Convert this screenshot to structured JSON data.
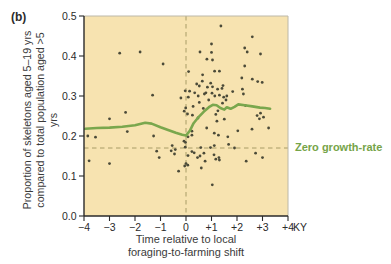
{
  "figure_label": "(b)",
  "colors": {
    "plot_bg": "#f7e3b0",
    "point": "#4b4a38",
    "trend": "#7aa74d",
    "reference": "#a89c66",
    "axis": "#2a2a2a",
    "tick_text": "#2b2b2b",
    "frame": "#bcb8a8",
    "label_green": "#76a449"
  },
  "chart_data": {
    "type": "scatter",
    "title": "",
    "xlabel_lines": [
      "Time relative to local",
      "foraging-to-farming shift"
    ],
    "ylabel_lines": [
      "Proportion of skeletons aged 5–19 yrs",
      "compared to total population aged >5 yrs"
    ],
    "xlim": [
      -4,
      4
    ],
    "ylim": [
      0,
      0.5
    ],
    "x_tick_values": [
      -4,
      -3,
      -2,
      -1,
      0,
      1,
      2,
      3,
      4
    ],
    "x_tick_labels": [
      "−4",
      "−3",
      "−2",
      "−1",
      "0",
      "+1",
      "+2",
      "+3",
      "+4"
    ],
    "x_unit_label": "KY",
    "y_tick_values": [
      0,
      0.1,
      0.2,
      0.3,
      0.4,
      0.5
    ],
    "y_tick_labels": [
      "0.0",
      "0.1",
      "0.2",
      "0.3",
      "0.4",
      "0.5"
    ],
    "grid": false,
    "legend": "none",
    "reference_lines": {
      "vertical_x": 0,
      "horizontal_y": 0.17,
      "horizontal_label": "Zero growth-rate"
    },
    "points": [
      [
        -3.85,
        0.2
      ],
      [
        -3.55,
        0.197
      ],
      [
        -3.8,
        0.138
      ],
      [
        -3.0,
        0.131
      ],
      [
        -3.0,
        0.243
      ],
      [
        -2.6,
        0.407
      ],
      [
        -2.37,
        0.259
      ],
      [
        -2.3,
        0.211
      ],
      [
        -1.8,
        0.41
      ],
      [
        -1.31,
        0.302
      ],
      [
        -1.27,
        0.2
      ],
      [
        -1.15,
        0.162
      ],
      [
        -1.05,
        0.146
      ],
      [
        -0.9,
        0.38
      ],
      [
        -0.58,
        0.163
      ],
      [
        -0.54,
        0.176
      ],
      [
        -0.45,
        0.155
      ],
      [
        -0.42,
        0.166
      ],
      [
        -0.29,
        0.112
      ],
      [
        -0.2,
        0.295
      ],
      [
        -0.08,
        0.187
      ],
      [
        -0.07,
        0.262
      ],
      [
        -0.05,
        0.125
      ],
      [
        -0.03,
        0.313
      ],
      [
        -0.03,
        0.172
      ],
      [
        -0.02,
        0.184
      ],
      [
        -0.01,
        0.27
      ],
      [
        0.0,
        0.131
      ],
      [
        0.06,
        0.255
      ],
      [
        0.07,
        0.127
      ],
      [
        0.08,
        0.198
      ],
      [
        0.08,
        0.151
      ],
      [
        0.09,
        0.297
      ],
      [
        0.1,
        0.361
      ],
      [
        0.14,
        0.312
      ],
      [
        0.23,
        0.202
      ],
      [
        0.23,
        0.212
      ],
      [
        0.23,
        0.161
      ],
      [
        0.25,
        0.252
      ],
      [
        0.28,
        0.274
      ],
      [
        0.32,
        0.158
      ],
      [
        0.34,
        0.308
      ],
      [
        0.42,
        0.33
      ],
      [
        0.45,
        0.146
      ],
      [
        0.47,
        0.245
      ],
      [
        0.48,
        0.3
      ],
      [
        0.52,
        0.325
      ],
      [
        0.52,
        0.284
      ],
      [
        0.55,
        0.41
      ],
      [
        0.55,
        0.15
      ],
      [
        0.58,
        0.171
      ],
      [
        0.6,
        0.12
      ],
      [
        0.64,
        0.337
      ],
      [
        0.65,
        0.353
      ],
      [
        0.68,
        0.269
      ],
      [
        0.7,
        0.157
      ],
      [
        0.72,
        0.305
      ],
      [
        0.75,
        0.137
      ],
      [
        0.78,
        0.308
      ],
      [
        0.81,
        0.22
      ],
      [
        0.82,
        0.392
      ],
      [
        0.84,
        0.322
      ],
      [
        0.89,
        0.29
      ],
      [
        0.96,
        0.171
      ],
      [
        0.97,
        0.332
      ],
      [
        1.0,
        0.43
      ],
      [
        1.0,
        0.409
      ],
      [
        1.02,
        0.307
      ],
      [
        1.03,
        0.078
      ],
      [
        1.04,
        0.39
      ],
      [
        1.04,
        0.323
      ],
      [
        1.1,
        0.153
      ],
      [
        1.11,
        0.207
      ],
      [
        1.11,
        0.176
      ],
      [
        1.12,
        0.362
      ],
      [
        1.13,
        0.3
      ],
      [
        1.17,
        0.142
      ],
      [
        1.17,
        0.254
      ],
      [
        1.21,
        0.237
      ],
      [
        1.24,
        0.317
      ],
      [
        1.25,
        0.263
      ],
      [
        1.27,
        0.202
      ],
      [
        1.29,
        0.146
      ],
      [
        1.31,
        0.14
      ],
      [
        1.31,
        0.362
      ],
      [
        1.31,
        0.302
      ],
      [
        1.37,
        0.475
      ],
      [
        1.41,
        0.319
      ],
      [
        1.43,
        0.282
      ],
      [
        1.45,
        0.326
      ],
      [
        1.48,
        0.297
      ],
      [
        1.5,
        0.242
      ],
      [
        1.57,
        0.29
      ],
      [
        1.6,
        0.3
      ],
      [
        1.64,
        0.198
      ],
      [
        1.67,
        0.179
      ],
      [
        1.83,
        0.311
      ],
      [
        1.9,
        0.17
      ],
      [
        2.03,
        0.213
      ],
      [
        2.19,
        0.345
      ],
      [
        2.21,
        0.317
      ],
      [
        2.25,
        0.305
      ],
      [
        2.3,
        0.375
      ],
      [
        2.3,
        0.42
      ],
      [
        2.33,
        0.276
      ],
      [
        2.36,
        0.137
      ],
      [
        2.4,
        0.41
      ],
      [
        2.59,
        0.217
      ],
      [
        2.6,
        0.448
      ],
      [
        2.6,
        0.342
      ],
      [
        2.73,
        0.157
      ],
      [
        2.79,
        0.251
      ],
      [
        2.81,
        0.336
      ],
      [
        2.88,
        0.243
      ],
      [
        2.92,
        0.405
      ],
      [
        2.92,
        0.257
      ],
      [
        2.99,
        0.334
      ],
      [
        3.0,
        0.146
      ],
      [
        3.04,
        0.247
      ],
      [
        3.24,
        0.22
      ]
    ],
    "trend_line": [
      [
        -3.95,
        0.218
      ],
      [
        -3.5,
        0.22
      ],
      [
        -3.0,
        0.221
      ],
      [
        -2.5,
        0.223
      ],
      [
        -2.0,
        0.227
      ],
      [
        -1.6,
        0.233
      ],
      [
        -1.35,
        0.231
      ],
      [
        -1.0,
        0.222
      ],
      [
        -0.7,
        0.215
      ],
      [
        -0.4,
        0.208
      ],
      [
        -0.15,
        0.203
      ],
      [
        0.0,
        0.201
      ],
      [
        0.15,
        0.213
      ],
      [
        0.3,
        0.232
      ],
      [
        0.5,
        0.248
      ],
      [
        0.7,
        0.261
      ],
      [
        0.9,
        0.272
      ],
      [
        1.05,
        0.278
      ],
      [
        1.2,
        0.277
      ],
      [
        1.35,
        0.27
      ],
      [
        1.5,
        0.266
      ],
      [
        1.6,
        0.272
      ],
      [
        1.75,
        0.268
      ],
      [
        1.9,
        0.273
      ],
      [
        2.05,
        0.279
      ],
      [
        2.3,
        0.277
      ],
      [
        2.6,
        0.274
      ],
      [
        2.9,
        0.271
      ],
      [
        3.1,
        0.27
      ],
      [
        3.3,
        0.268
      ]
    ]
  }
}
